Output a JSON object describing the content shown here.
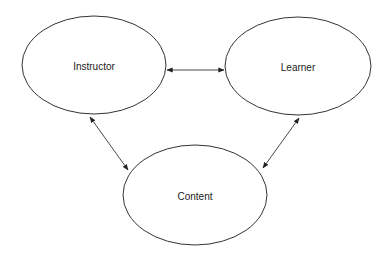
{
  "diagram": {
    "type": "triangle-relationship",
    "nodes": [
      {
        "id": "instructor",
        "label": "Instructor",
        "cx": 94,
        "cy": 65,
        "rx": 72,
        "ry": 49
      },
      {
        "id": "learner",
        "label": "Learner",
        "cx": 298,
        "cy": 66,
        "rx": 73,
        "ry": 49
      },
      {
        "id": "content",
        "label": "Content",
        "cx": 195,
        "cy": 195,
        "rx": 72,
        "ry": 50
      }
    ],
    "edges": [
      {
        "from": "instructor",
        "to": "learner",
        "direction": "bidirectional",
        "x1": 167,
        "y1": 70,
        "x2": 224,
        "y2": 70
      },
      {
        "from": "instructor",
        "to": "content",
        "direction": "bidirectional",
        "x1": 90,
        "y1": 117,
        "x2": 128,
        "y2": 170
      },
      {
        "from": "learner",
        "to": "content",
        "direction": "bidirectional",
        "x1": 299,
        "y1": 118,
        "x2": 263,
        "y2": 168
      }
    ]
  },
  "colors": {
    "background": "#ffffff",
    "stroke": "#333333",
    "text": "#222222"
  }
}
